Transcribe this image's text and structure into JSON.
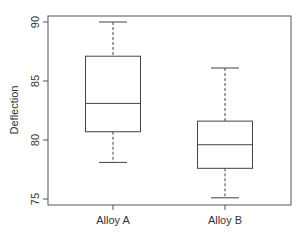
{
  "chart_data": {
    "type": "boxplot",
    "title": "",
    "xlabel": "",
    "ylabel": "Deflection",
    "ylim": [
      74.7,
      91.0
    ],
    "yticks": [
      75,
      80,
      85,
      90
    ],
    "categories": [
      "Alloy A",
      "Alloy B"
    ],
    "boxes": [
      {
        "name": "Alloy A",
        "whisker_low": 78.1,
        "q1": 80.7,
        "median": 83.1,
        "q3": 87.1,
        "whisker_high": 90.0
      },
      {
        "name": "Alloy B",
        "whisker_low": 75.1,
        "q1": 77.6,
        "median": 79.6,
        "q3": 81.6,
        "whisker_high": 86.1
      }
    ],
    "grid": false,
    "legend": null
  },
  "colors": {
    "line": "#444444",
    "frame": "#555555",
    "text": "#333333"
  }
}
